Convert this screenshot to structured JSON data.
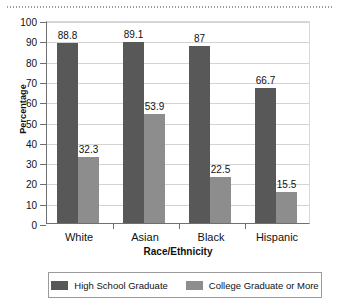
{
  "chart_data": {
    "type": "bar",
    "title": "",
    "xlabel": "Race/Ethnicity",
    "ylabel": "Percentage",
    "ylim": [
      0,
      100
    ],
    "ytick_step": 10,
    "yticks": [
      0,
      10,
      20,
      30,
      40,
      50,
      60,
      70,
      80,
      90,
      100
    ],
    "grid": true,
    "legend_position": "bottom",
    "categories": [
      "White",
      "Asian",
      "Black",
      "Hispanic"
    ],
    "series": [
      {
        "name": "High School Graduate",
        "color": "#585858",
        "values": [
          88.8,
          89.1,
          87,
          66.7
        ],
        "labels": [
          "88.8",
          "89.1",
          "87",
          "66.7"
        ]
      },
      {
        "name": "College Graduate or More",
        "color": "#8d8d8d",
        "values": [
          32.3,
          53.9,
          22.5,
          15.5
        ],
        "labels": [
          "32.3",
          "53.9",
          "22.5",
          "15.5"
        ]
      }
    ]
  },
  "axes": {
    "y_title": "Percentage",
    "x_title": "Race/Ethnicity",
    "y_tick_labels": [
      "100",
      "90",
      "80",
      "70",
      "60",
      "50",
      "40",
      "30",
      "20",
      "10",
      "0"
    ],
    "x_tick_labels": [
      "White",
      "Asian",
      "Black",
      "Hispanic"
    ]
  },
  "legend": {
    "items": [
      {
        "label": "High School Graduate",
        "color": "#585858"
      },
      {
        "label": "College Graduate or More",
        "color": "#8d8d8d"
      }
    ]
  }
}
